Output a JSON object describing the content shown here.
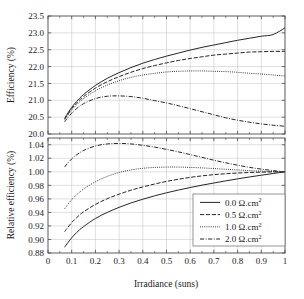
{
  "figure": {
    "background_color": "#ffffff",
    "axis_color": "#4a4a4a",
    "grid_color": "#c9c9c9",
    "curve_color": "#262626",
    "legend_border_color": "#7a7a7a"
  },
  "chart_data": [
    {
      "type": "line",
      "panel": "upper",
      "title": "",
      "xlabel": "",
      "ylabel": "Efficiency (%)",
      "xlim": [
        0,
        1
      ],
      "ylim": [
        20.0,
        23.5
      ],
      "xticks": [
        0,
        0.1,
        0.2,
        0.3,
        0.4,
        0.5,
        0.6,
        0.7,
        0.8,
        0.9,
        1
      ],
      "xticklabels": [
        "0",
        "0.1",
        "0.2",
        "0.3",
        "0.4",
        "0.5",
        "0.6",
        "0.7",
        "0.8",
        "0.9",
        "1"
      ],
      "yticks": [
        20.0,
        20.5,
        21.0,
        21.5,
        22.0,
        22.5,
        23.0,
        23.5
      ],
      "yticklabels": [
        "20.0",
        "20.5",
        "21.0",
        "21.5",
        "22.0",
        "22.5",
        "23.0",
        "23.5"
      ],
      "grid": true,
      "legend_position": "none",
      "x": [
        0.07,
        0.08,
        0.1,
        0.12,
        0.15,
        0.2,
        0.25,
        0.3,
        0.35,
        0.4,
        0.45,
        0.5,
        0.55,
        0.6,
        0.65,
        0.7,
        0.75,
        0.8,
        0.85,
        0.9,
        0.95,
        1.0
      ],
      "series": [
        {
          "name": "0.0 Ω.cm²",
          "linestyle": "solid",
          "values": [
            20.46,
            20.58,
            20.79,
            20.96,
            21.17,
            21.44,
            21.65,
            21.82,
            21.97,
            22.1,
            22.21,
            22.31,
            22.4,
            22.49,
            22.57,
            22.64,
            22.71,
            22.78,
            22.84,
            22.9,
            22.95,
            23.15
          ]
        },
        {
          "name": "0.5 Ω.cm²",
          "linestyle": "dashed",
          "values": [
            20.44,
            20.55,
            20.75,
            20.91,
            21.11,
            21.36,
            21.55,
            21.7,
            21.83,
            21.94,
            22.03,
            22.11,
            22.18,
            22.24,
            22.29,
            22.34,
            22.37,
            22.4,
            22.43,
            22.44,
            22.45,
            22.45
          ]
        },
        {
          "name": "1.0 Ω.cm²",
          "linestyle": "dotted",
          "values": [
            20.41,
            20.52,
            20.71,
            20.86,
            21.05,
            21.28,
            21.45,
            21.58,
            21.68,
            21.75,
            21.8,
            21.84,
            21.86,
            21.87,
            21.87,
            21.86,
            21.85,
            21.83,
            21.8,
            21.78,
            21.75,
            21.72
          ]
        },
        {
          "name": "2.0 Ω.cm²",
          "linestyle": "dashdot",
          "values": [
            20.36,
            20.45,
            20.62,
            20.75,
            20.9,
            21.05,
            21.12,
            21.13,
            21.11,
            21.06,
            20.99,
            20.92,
            20.84,
            20.75,
            20.66,
            20.57,
            20.48,
            20.41,
            20.35,
            20.3,
            20.26,
            20.23
          ]
        }
      ]
    },
    {
      "type": "line",
      "panel": "lower",
      "title": "",
      "xlabel": "Irradiance (suns)",
      "ylabel": "Relative efficiency (%)",
      "xlim": [
        0,
        1
      ],
      "ylim": [
        0.88,
        1.05
      ],
      "xticks": [
        0,
        0.1,
        0.2,
        0.3,
        0.4,
        0.5,
        0.6,
        0.7,
        0.8,
        0.9,
        1
      ],
      "xticklabels": [
        "0",
        "0.1",
        "0.2",
        "0.3",
        "0.4",
        "0.5",
        "0.6",
        "0.7",
        "0.8",
        "0.9",
        "1"
      ],
      "yticks": [
        0.88,
        0.9,
        0.92,
        0.94,
        0.96,
        0.98,
        1.0,
        1.02,
        1.04
      ],
      "yticklabels": [
        "0.88",
        "0.90",
        "0.92",
        "0.94",
        "0.96",
        "0.98",
        "1.00",
        "1.02",
        "1.04"
      ],
      "grid": true,
      "legend_position": "lower right",
      "x": [
        0.07,
        0.08,
        0.1,
        0.12,
        0.15,
        0.2,
        0.25,
        0.3,
        0.35,
        0.4,
        0.45,
        0.5,
        0.55,
        0.6,
        0.65,
        0.7,
        0.75,
        0.8,
        0.85,
        0.9,
        0.95,
        1.0
      ],
      "series": [
        {
          "name": "0.0 Ω.cm²",
          "linestyle": "solid",
          "values": [
            0.8885,
            0.8935,
            0.9025,
            0.91,
            0.919,
            0.931,
            0.94,
            0.9475,
            0.954,
            0.9595,
            0.9645,
            0.969,
            0.973,
            0.9768,
            0.9803,
            0.9835,
            0.9866,
            0.9896,
            0.9924,
            0.995,
            0.9975,
            1.0
          ]
        },
        {
          "name": "0.5 Ω.cm²",
          "linestyle": "dashed",
          "values": [
            0.9115,
            0.9162,
            0.925,
            0.932,
            0.9408,
            0.9518,
            0.9602,
            0.967,
            0.9728,
            0.9777,
            0.982,
            0.9858,
            0.989,
            0.9918,
            0.994,
            0.9958,
            0.9972,
            0.9982,
            0.999,
            0.9995,
            0.9999,
            1.0
          ]
        },
        {
          "name": "1.0 Ω.cm²",
          "linestyle": "dotted",
          "values": [
            0.9452,
            0.95,
            0.9588,
            0.9658,
            0.9745,
            0.9853,
            0.9932,
            0.999,
            1.0028,
            1.0052,
            1.0065,
            1.007,
            1.007,
            1.0065,
            1.0058,
            1.0048,
            1.0038,
            1.0028,
            1.0018,
            1.001,
            1.0004,
            1.0
          ]
        },
        {
          "name": "2.0 Ω.cm²",
          "linestyle": "dashdot",
          "values": [
            1.007,
            1.0115,
            1.019,
            1.025,
            1.0315,
            1.0382,
            1.0412,
            1.042,
            1.0412,
            1.0392,
            1.0365,
            1.0332,
            1.0295,
            1.0255,
            1.0213,
            1.0172,
            1.0133,
            1.0098,
            1.0066,
            1.004,
            1.0018,
            1.0
          ]
        }
      ]
    }
  ],
  "legend": {
    "entries": [
      {
        "label_value": "0.0",
        "label_unit": "Ω.cm",
        "label_sup": "2",
        "linestyle": "solid"
      },
      {
        "label_value": "0.5",
        "label_unit": "Ω.cm",
        "label_sup": "2",
        "linestyle": "dashed"
      },
      {
        "label_value": "1.0",
        "label_unit": "Ω.cm",
        "label_sup": "2",
        "linestyle": "dotted"
      },
      {
        "label_value": "2.0",
        "label_unit": "Ω.cm",
        "label_sup": "2",
        "linestyle": "dashdot"
      }
    ]
  }
}
